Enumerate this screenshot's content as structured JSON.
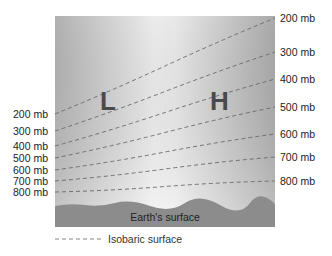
{
  "diagram": {
    "type": "isobaric-surfaces-cross-section",
    "panel": {
      "x": 55,
      "y": 16,
      "width": 220,
      "height": 211
    },
    "centers": [
      {
        "label": "L",
        "meaning": "low pressure",
        "x": 103,
        "y": 88
      },
      {
        "label": "H",
        "meaning": "high pressure",
        "x": 212,
        "y": 88
      }
    ],
    "isobars": [
      {
        "value": "200 mb",
        "left_y": 114,
        "right_y": 18
      },
      {
        "value": "300 mb",
        "left_y": 131,
        "right_y": 52
      },
      {
        "value": "400 mb",
        "left_y": 146,
        "right_y": 79
      },
      {
        "value": "500 mb",
        "left_y": 158,
        "right_y": 107
      },
      {
        "value": "600 mb",
        "left_y": 170,
        "right_y": 134
      },
      {
        "value": "700 mb",
        "left_y": 181,
        "right_y": 157
      },
      {
        "value": "800 mb",
        "left_y": 192,
        "right_y": 181
      }
    ],
    "ground_label": "Earth's surface",
    "legend_label": "Isobaric surface",
    "colors": {
      "ground": "#8a8a8a",
      "sky_dark": "#b4b4b4",
      "sky_light": "#f4f4f4",
      "isobar": "#666666"
    }
  },
  "labels": {
    "left": [
      "200 mb",
      "300 mb",
      "400 mb",
      "500 mb",
      "600 mb",
      "700 mb",
      "800 mb"
    ],
    "right": [
      "200 mb",
      "300 mb",
      "400 mb",
      "500 mb",
      "600 mb",
      "700 mb",
      "800 mb"
    ],
    "L": "L",
    "H": "H",
    "earth": "Earth's surface",
    "legend": "Isobaric surface"
  }
}
